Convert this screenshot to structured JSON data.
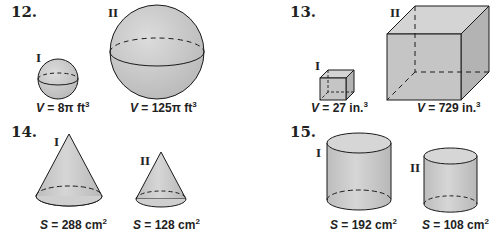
{
  "problems": [
    {
      "number": "12.",
      "shape": "sphere",
      "figures": [
        {
          "label": "I",
          "var": "V",
          "eq": " = 8π ft",
          "exp": "3"
        },
        {
          "label": "II",
          "var": "V",
          "eq": " = 125π ft",
          "exp": "3"
        }
      ]
    },
    {
      "number": "13.",
      "shape": "cube",
      "figures": [
        {
          "label": "I",
          "var": "V",
          "eq": " = 27 in.",
          "exp": "3"
        },
        {
          "label": "II",
          "var": "V",
          "eq": " = 729 in.",
          "exp": "3"
        }
      ]
    },
    {
      "number": "14.",
      "shape": "cone",
      "figures": [
        {
          "label": "I",
          "var": "S",
          "eq": " = 288 cm",
          "exp": "2"
        },
        {
          "label": "II",
          "var": "S",
          "eq": " = 128 cm",
          "exp": "2"
        }
      ]
    },
    {
      "number": "15.",
      "shape": "cylinder",
      "figures": [
        {
          "label": "I",
          "var": "S",
          "eq": " = 192 cm",
          "exp": "2"
        },
        {
          "label": "II",
          "var": "S",
          "eq": " = 108 cm",
          "exp": "2"
        }
      ]
    }
  ],
  "colors": {
    "fill": "#c8c8c8",
    "fill_light": "#d9d9d9",
    "fill_dark": "#b4b4b4",
    "stroke": "#1a1a1a"
  }
}
